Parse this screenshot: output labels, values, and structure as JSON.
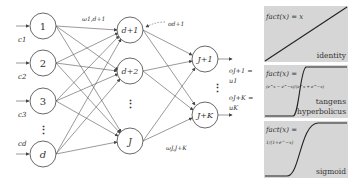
{
  "network": {
    "input_nodes": [
      "1",
      "2",
      "3",
      "d"
    ],
    "input_labels": [
      "c1",
      "c2",
      "c3",
      "cd"
    ],
    "hidden_nodes": [
      "d+1",
      "d+2",
      "J"
    ],
    "output_nodes": [
      "J+1",
      "J+K"
    ],
    "weight_label_top": "ω1,d+1",
    "weight_label_bottom": "ωJ,J+K",
    "hidden_output_label": "od+1",
    "output_label_1a": "oJ+1 =",
    "output_label_1b": "u1",
    "output_label_2a": "oJ+K =",
    "output_label_2b": "uK",
    "ellipsis": "⋮"
  },
  "activation_panels": [
    {
      "name": "identity",
      "formula": "fact(x) = x",
      "label": "identity"
    },
    {
      "name": "tanh",
      "formula": "fact(x) =",
      "sub_formula": "(e^x − e^−x)/(e^x + e^−x)",
      "label_line1": "tangens",
      "label_line2": "hyperbolicus"
    },
    {
      "name": "sigmoid",
      "formula": "fact(x) =",
      "sub_formula": "1/(1+e^−x)",
      "label": "sigmoid"
    }
  ]
}
